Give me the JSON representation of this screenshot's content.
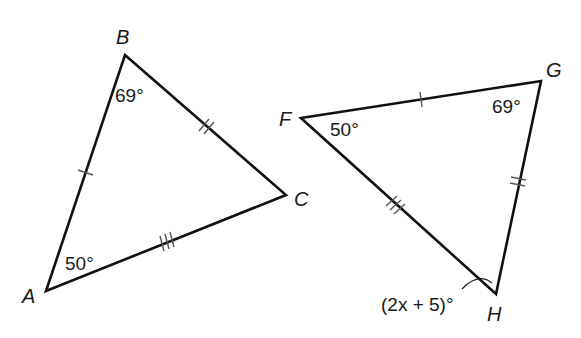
{
  "diagram": {
    "type": "congruent-triangles",
    "triangles": [
      {
        "name": "ABC",
        "vertices": {
          "A": {
            "label": "A",
            "x": 46,
            "y": 291
          },
          "B": {
            "label": "B",
            "x": 125,
            "y": 55
          },
          "C": {
            "label": "C",
            "x": 286,
            "y": 195
          }
        },
        "angles": {
          "A": "50°",
          "B": "69°"
        },
        "side_marks": {
          "AB": 1,
          "BC": 2,
          "CA": 3
        }
      },
      {
        "name": "FGH",
        "vertices": {
          "F": {
            "label": "F",
            "x": 301,
            "y": 118
          },
          "G": {
            "label": "G",
            "x": 541,
            "y": 81
          },
          "H": {
            "label": "H",
            "x": 496,
            "y": 294
          }
        },
        "angles": {
          "F": "50°",
          "G": "69°",
          "H": "(2x + 5)°"
        },
        "side_marks": {
          "FG": 1,
          "GH": 2,
          "HF": 3
        }
      }
    ],
    "labels": {
      "A": "A",
      "B": "B",
      "C": "C",
      "F": "F",
      "G": "G",
      "H": "H",
      "angle_A": "50°",
      "angle_B": "69°",
      "angle_F": "50°",
      "angle_G": "69°",
      "angle_H": "(2x + 5)°"
    }
  }
}
